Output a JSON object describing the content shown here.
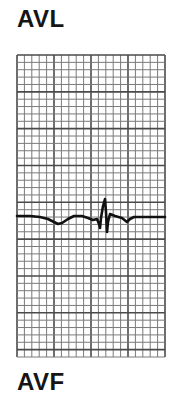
{
  "labels": {
    "top": "AVL",
    "bottom": "AVF"
  },
  "grid": {
    "x": 17,
    "y": 55,
    "width": 148,
    "height": 302,
    "minor_step": 7.4,
    "major_every": 5,
    "minor_color": "#7a7a7a",
    "major_color": "#4a4a4a",
    "background": "#ffffff"
  },
  "trace": {
    "color": "#111111",
    "stroke_width": 2.6,
    "points": [
      [
        17,
        216
      ],
      [
        30,
        216
      ],
      [
        40,
        217
      ],
      [
        48,
        219
      ],
      [
        54,
        222
      ],
      [
        58,
        224
      ],
      [
        62,
        223
      ],
      [
        68,
        219
      ],
      [
        74,
        216
      ],
      [
        82,
        216
      ],
      [
        88,
        218
      ],
      [
        93,
        220
      ],
      [
        97,
        219
      ],
      [
        99,
        224
      ],
      [
        100,
        228
      ],
      [
        101,
        218
      ],
      [
        103,
        206
      ],
      [
        105,
        199
      ],
      [
        106,
        212
      ],
      [
        107,
        232
      ],
      [
        108,
        222
      ],
      [
        110,
        214
      ],
      [
        115,
        216
      ],
      [
        122,
        218
      ],
      [
        127,
        222
      ],
      [
        130,
        219
      ],
      [
        134,
        217
      ],
      [
        145,
        217
      ],
      [
        165,
        217
      ]
    ]
  }
}
